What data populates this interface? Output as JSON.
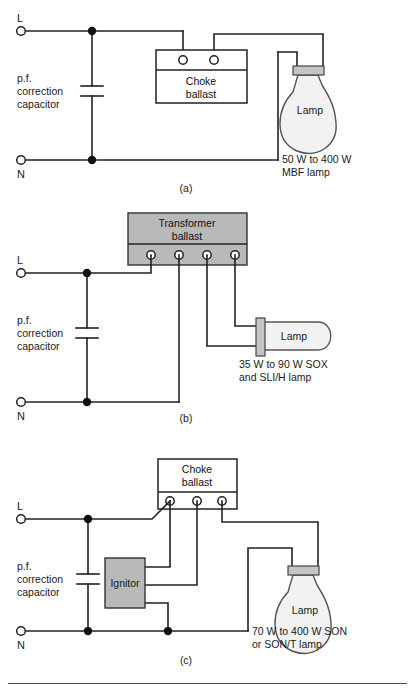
{
  "figure": {
    "panels": [
      {
        "id": "a",
        "caption": "(a)",
        "supply": {
          "live_label": "L",
          "neutral_label": "N"
        },
        "capacitor": {
          "label_line1": "p.f.",
          "label_line2": "correction",
          "label_line3": "capacitor",
          "symbol": "capacitor-plates"
        },
        "ballast": {
          "name": "choke-ballast",
          "label_line1": "Choke",
          "label_line2": "ballast",
          "fill": "#ffffff",
          "terminals": 2,
          "terminal_strip": "top"
        },
        "lamp": {
          "label": "Lamp",
          "shape": "ovoid-bulb",
          "glass_fill": "#f2f2f2",
          "cap_fill": "#c4c4c4"
        },
        "rating": {
          "line1": "50 W to 400 W",
          "line2": "MBF lamp"
        }
      },
      {
        "id": "b",
        "caption": "(b)",
        "supply": {
          "live_label": "L",
          "neutral_label": "N"
        },
        "capacitor": {
          "label_line1": "p.f.",
          "label_line2": "correction",
          "label_line3": "capacitor",
          "symbol": "capacitor-plates"
        },
        "ballast": {
          "name": "transformer-ballast",
          "label_line1": "Transformer",
          "label_line2": "ballast",
          "fill": "#b9b9b9",
          "terminals": 4,
          "terminal_strip": "bottom"
        },
        "lamp": {
          "label": "Lamp",
          "shape": "tubular-lamp",
          "glass_fill": "#f2f2f2",
          "cap_fill": "#c4c4c4"
        },
        "rating": {
          "line1": "35 W to 90 W SOX",
          "line2": "and SLI/H lamp"
        }
      },
      {
        "id": "c",
        "caption": "(c)",
        "supply": {
          "live_label": "L",
          "neutral_label": "N"
        },
        "capacitor": {
          "label_line1": "p.f.",
          "label_line2": "correction",
          "label_line3": "capacitor",
          "symbol": "capacitor-plates"
        },
        "ballast": {
          "name": "choke-ballast",
          "label_line1": "Choke",
          "label_line2": "ballast",
          "fill": "#ffffff",
          "terminals": 3,
          "terminal_strip": "bottom"
        },
        "ignitor": {
          "label": "Ignitor",
          "fill": "#b9b9b9"
        },
        "lamp": {
          "label": "Lamp",
          "shape": "ovoid-bulb",
          "glass_fill": "#f2f2f2",
          "cap_fill": "#c4c4c4"
        },
        "rating": {
          "line1": "70 W to 400 W SON",
          "line2": "or SON/T lamp"
        }
      }
    ]
  },
  "colors": {
    "wire": "#222222",
    "junction": "#111111",
    "gray_fill": "#b9b9b9",
    "glass_fill": "#f2f2f2",
    "cap_fill": "#c4c4c4",
    "background": "#ffffff"
  }
}
